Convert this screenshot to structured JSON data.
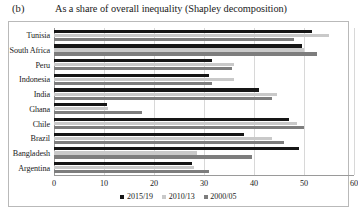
{
  "figure": {
    "panel_letter": "(b)",
    "title": "As a share of overall inequality (Shapley decomposition)"
  },
  "chart_data": {
    "type": "bar",
    "orientation": "horizontal",
    "title": "As a share of overall inequality (Shapley decomposition)",
    "xlabel": "",
    "ylabel": "",
    "xlim": [
      0,
      60
    ],
    "xticks": [
      0,
      10,
      20,
      30,
      40,
      50,
      60
    ],
    "grid": true,
    "legend_position": "bottom",
    "categories": [
      "Tunisia",
      "South Africa",
      "Peru",
      "Indonesia",
      "India",
      "Ghana",
      "Chile",
      "Brazil",
      "Bangladesh",
      "Argentina"
    ],
    "series": [
      {
        "name": "2015/19",
        "color": "#161616",
        "values": [
          51.5,
          49.5,
          31.5,
          31.0,
          41.0,
          10.5,
          47.0,
          38.0,
          49.0,
          27.5
        ]
      },
      {
        "name": "2010/13",
        "color": "#c9c9c9",
        "values": [
          55.0,
          50.0,
          36.0,
          36.0,
          44.5,
          10.8,
          48.5,
          43.5,
          28.5,
          28.0
        ]
      },
      {
        "name": "2000/05",
        "color": "#7d7d7d",
        "values": [
          48.0,
          52.5,
          35.5,
          31.5,
          43.5,
          17.5,
          50.0,
          46.0,
          39.5,
          31.0
        ]
      }
    ]
  },
  "legend": {
    "items": [
      {
        "label": "2015/19"
      },
      {
        "label": "2010/13"
      },
      {
        "label": "2000/05"
      }
    ]
  }
}
